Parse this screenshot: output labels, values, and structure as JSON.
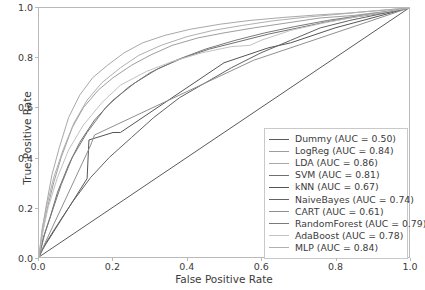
{
  "chart_data": {
    "type": "line",
    "title": "",
    "xlabel": "False Positive Rate",
    "ylabel": "True Positive Rate",
    "xlim": [
      0.0,
      1.0
    ],
    "ylim": [
      0.0,
      1.0
    ],
    "xticks": [
      "0.0",
      "0.2",
      "0.4",
      "0.6",
      "0.8",
      "1.0"
    ],
    "yticks": [
      "0.0",
      "0.2",
      "0.4",
      "0.6",
      "0.8",
      "1.0"
    ],
    "grid": false,
    "legend_position": "lower right",
    "series": [
      {
        "name": "Dummy",
        "auc": "0.50",
        "label": "Dummy (AUC = 0.50)",
        "color": "#5a5a5a",
        "x": [
          0.0,
          1.0
        ],
        "y": [
          0.0,
          1.0
        ]
      },
      {
        "name": "LogReg",
        "auc": "0.84",
        "label": "LogReg (AUC = 0.84)",
        "color": "#9e9e9e",
        "x": [
          0.0,
          0.01,
          0.02,
          0.04,
          0.06,
          0.09,
          0.12,
          0.16,
          0.2,
          0.25,
          0.3,
          0.36,
          0.43,
          0.5,
          0.58,
          0.67,
          0.76,
          0.85,
          0.93,
          1.0
        ],
        "y": [
          0.0,
          0.1,
          0.18,
          0.3,
          0.4,
          0.52,
          0.6,
          0.67,
          0.72,
          0.77,
          0.81,
          0.85,
          0.88,
          0.9,
          0.92,
          0.94,
          0.96,
          0.97,
          0.985,
          1.0
        ]
      },
      {
        "name": "LDA",
        "auc": "0.86",
        "label": "LDA (AUC = 0.86)",
        "color": "#a8a8a8",
        "x": [
          0.0,
          0.01,
          0.02,
          0.035,
          0.055,
          0.08,
          0.11,
          0.145,
          0.185,
          0.23,
          0.28,
          0.34,
          0.41,
          0.49,
          0.57,
          0.66,
          0.75,
          0.84,
          0.92,
          1.0
        ],
        "y": [
          0.0,
          0.12,
          0.21,
          0.33,
          0.44,
          0.56,
          0.65,
          0.72,
          0.77,
          0.82,
          0.86,
          0.89,
          0.915,
          0.935,
          0.95,
          0.962,
          0.972,
          0.98,
          0.99,
          1.0
        ]
      },
      {
        "name": "SVM",
        "auc": "0.81",
        "label": "SVM (AUC = 0.81)",
        "color": "#6f6f6f",
        "x": [
          0.0,
          0.012,
          0.03,
          0.05,
          0.08,
          0.11,
          0.15,
          0.2,
          0.26,
          0.32,
          0.39,
          0.46,
          0.54,
          0.62,
          0.7,
          0.78,
          0.86,
          0.93,
          1.0
        ],
        "y": [
          0.0,
          0.08,
          0.16,
          0.26,
          0.37,
          0.46,
          0.55,
          0.63,
          0.7,
          0.755,
          0.8,
          0.835,
          0.865,
          0.895,
          0.92,
          0.945,
          0.965,
          0.98,
          1.0
        ]
      },
      {
        "name": "kNN",
        "auc": "0.67",
        "label": "kNN (AUC = 0.67)",
        "color": "#555555",
        "x": [
          0.0,
          0.005,
          0.13,
          0.135,
          0.2,
          0.22,
          0.5,
          0.62,
          0.68,
          0.8,
          1.0
        ],
        "y": [
          0.0,
          0.02,
          0.315,
          0.47,
          0.5,
          0.5,
          0.78,
          0.84,
          0.86,
          0.92,
          1.0
        ]
      },
      {
        "name": "NaiveBayes",
        "auc": "0.74",
        "label": "NaiveBayes (AUC = 0.74)",
        "color": "#636363",
        "x": [
          0.0,
          0.02,
          0.05,
          0.09,
          0.14,
          0.19,
          0.25,
          0.31,
          0.38,
          0.45,
          0.52,
          0.6,
          0.68,
          0.76,
          0.84,
          0.92,
          1.0
        ],
        "y": [
          0.0,
          0.06,
          0.13,
          0.22,
          0.32,
          0.4,
          0.48,
          0.56,
          0.64,
          0.7,
          0.76,
          0.82,
          0.87,
          0.92,
          0.95,
          0.975,
          1.0
        ]
      },
      {
        "name": "CART",
        "auc": "0.61",
        "label": "CART (AUC = 0.61)",
        "color": "#8f8f8f",
        "x": [
          0.0,
          0.005,
          0.14,
          0.15,
          0.58,
          1.0
        ],
        "y": [
          0.0,
          0.02,
          0.45,
          0.49,
          0.79,
          1.0
        ]
      },
      {
        "name": "RandomForest",
        "auc": "0.79",
        "label": "RandomForest (AUC = 0.79)",
        "color": "#7a7a7a",
        "x": [
          0.0,
          0.015,
          0.035,
          0.06,
          0.09,
          0.13,
          0.18,
          0.24,
          0.3,
          0.37,
          0.45,
          0.53,
          0.61,
          0.69,
          0.78,
          0.87,
          0.94,
          1.0
        ],
        "y": [
          0.0,
          0.09,
          0.18,
          0.29,
          0.4,
          0.5,
          0.6,
          0.68,
          0.74,
          0.79,
          0.835,
          0.87,
          0.9,
          0.925,
          0.95,
          0.97,
          0.985,
          1.0
        ]
      },
      {
        "name": "AdaBoost",
        "auc": "0.78",
        "label": "AdaBoost (AUC = 0.78)",
        "color": "#c2c2c2",
        "x": [
          0.0,
          0.01,
          0.025,
          0.05,
          0.08,
          0.12,
          0.17,
          0.22,
          0.29,
          0.36,
          0.44,
          0.52,
          0.57,
          0.6,
          0.68,
          0.77,
          0.86,
          0.94,
          1.0
        ],
        "y": [
          0.0,
          0.1,
          0.2,
          0.32,
          0.43,
          0.53,
          0.62,
          0.69,
          0.745,
          0.785,
          0.82,
          0.845,
          0.85,
          0.87,
          0.91,
          0.94,
          0.965,
          0.985,
          1.0
        ]
      },
      {
        "name": "MLP",
        "auc": "0.84",
        "label": "MLP (AUC = 0.84)",
        "color": "#b0b0b0",
        "x": [
          0.0,
          0.008,
          0.02,
          0.04,
          0.065,
          0.095,
          0.13,
          0.17,
          0.22,
          0.27,
          0.33,
          0.4,
          0.47,
          0.55,
          0.63,
          0.72,
          0.81,
          0.9,
          1.0
        ],
        "y": [
          0.0,
          0.11,
          0.2,
          0.32,
          0.43,
          0.54,
          0.63,
          0.7,
          0.76,
          0.81,
          0.85,
          0.885,
          0.91,
          0.93,
          0.948,
          0.963,
          0.975,
          0.988,
          1.0
        ]
      }
    ]
  }
}
